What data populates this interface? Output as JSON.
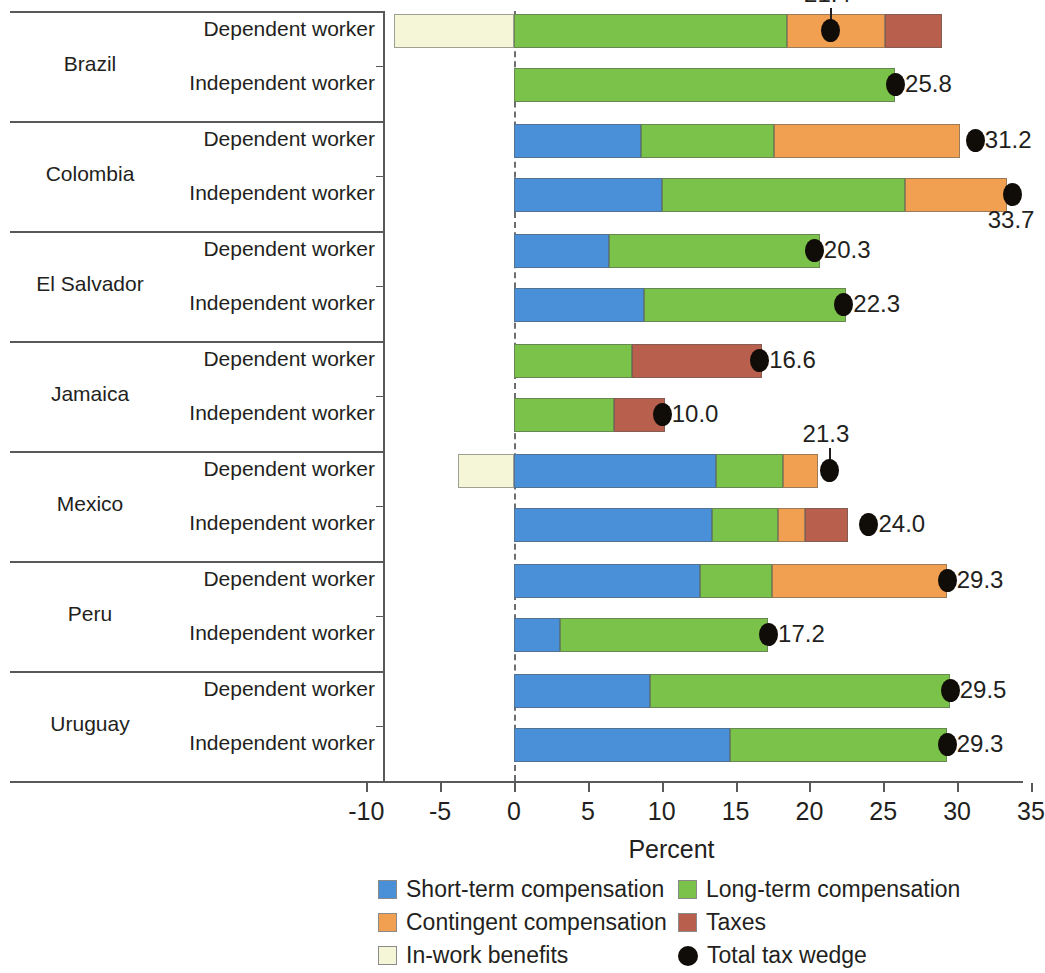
{
  "chart_data": {
    "type": "bar",
    "orientation": "horizontal",
    "stacked": true,
    "title": "",
    "xlabel": "Percent",
    "ylabel": "",
    "xlim": [
      -11.5,
      35.5
    ],
    "xticks": [
      -10,
      -5,
      0,
      5,
      10,
      15,
      20,
      25,
      30,
      35
    ],
    "xticklabels": [
      "-10",
      "-5",
      "0",
      "5",
      "10",
      "15",
      "20",
      "25",
      "30",
      "35"
    ],
    "grid": false,
    "zero_reference_line": true,
    "legend_position": "bottom",
    "series": [
      {
        "name": "Short-term compensation",
        "color": "#4a90d9"
      },
      {
        "name": "Long-term compensation",
        "color": "#7ac24a"
      },
      {
        "name": "Contingent compensation",
        "color": "#f0a050"
      },
      {
        "name": "Taxes",
        "color": "#b8604d"
      },
      {
        "name": "In-work benefits",
        "color": "#f5f6d8"
      }
    ],
    "marker": {
      "name": "Total tax wedge",
      "color": "#100c08",
      "shape": "circle"
    },
    "groups": [
      {
        "country": "Brazil",
        "rows": [
          {
            "worker": "Dependent worker",
            "in_work_benefits": -8.1,
            "short_term": 0.0,
            "long_term": 18.5,
            "contingent": 6.6,
            "taxes": 3.9,
            "total_tax_wedge": 21.4,
            "label": "21.4",
            "label_above": true
          },
          {
            "worker": "Independent worker",
            "in_work_benefits": 0.0,
            "short_term": 0.0,
            "long_term": 25.8,
            "contingent": 0.0,
            "taxes": 0.0,
            "total_tax_wedge": 25.8,
            "label": "25.8",
            "label_above": false
          }
        ]
      },
      {
        "country": "Colombia",
        "rows": [
          {
            "worker": "Dependent worker",
            "in_work_benefits": 0.0,
            "short_term": 8.6,
            "long_term": 9.0,
            "contingent": 12.6,
            "taxes": 0.0,
            "total_tax_wedge": 31.2,
            "label": "31.2",
            "label_above": false
          },
          {
            "worker": "Independent worker",
            "in_work_benefits": 0.0,
            "short_term": 10.0,
            "long_term": 16.5,
            "contingent": 6.9,
            "taxes": 0.0,
            "total_tax_wedge": 33.7,
            "label": "33.7",
            "label_above": false,
            "label_below": true
          }
        ]
      },
      {
        "country": "El Salvador",
        "rows": [
          {
            "worker": "Dependent worker",
            "in_work_benefits": 0.0,
            "short_term": 6.4,
            "long_term": 14.3,
            "contingent": 0.0,
            "taxes": 0.0,
            "total_tax_wedge": 20.3,
            "label": "20.3",
            "label_above": false
          },
          {
            "worker": "Independent worker",
            "in_work_benefits": 0.0,
            "short_term": 8.8,
            "long_term": 13.7,
            "contingent": 0.0,
            "taxes": 0.0,
            "total_tax_wedge": 22.3,
            "label": "22.3",
            "label_above": false
          }
        ]
      },
      {
        "country": "Jamaica",
        "rows": [
          {
            "worker": "Dependent worker",
            "in_work_benefits": 0.0,
            "short_term": 0.0,
            "long_term": 8.0,
            "contingent": 0.0,
            "taxes": 8.8,
            "total_tax_wedge": 16.6,
            "label": "16.6",
            "label_above": false
          },
          {
            "worker": "Independent worker",
            "in_work_benefits": 0.0,
            "short_term": 0.0,
            "long_term": 6.8,
            "contingent": 0.0,
            "taxes": 3.4,
            "total_tax_wedge": 10.0,
            "label": "10.0",
            "label_above": false
          }
        ]
      },
      {
        "country": "Mexico",
        "rows": [
          {
            "worker": "Dependent worker",
            "in_work_benefits": -3.8,
            "short_term": 13.7,
            "long_term": 4.5,
            "contingent": 2.4,
            "taxes": 0.0,
            "total_tax_wedge": 21.3,
            "label": "21.3",
            "label_above": true
          },
          {
            "worker": "Independent worker",
            "in_work_benefits": 0.0,
            "short_term": 13.4,
            "long_term": 4.5,
            "contingent": 1.8,
            "taxes": 2.9,
            "total_tax_wedge": 24.0,
            "label": "24.0",
            "label_above": false
          }
        ]
      },
      {
        "country": "Peru",
        "rows": [
          {
            "worker": "Dependent worker",
            "in_work_benefits": 0.0,
            "short_term": 12.6,
            "long_term": 4.9,
            "contingent": 11.8,
            "taxes": 0.0,
            "total_tax_wedge": 29.3,
            "label": "29.3",
            "label_above": false
          },
          {
            "worker": "Independent worker",
            "in_work_benefits": 0.0,
            "short_term": 3.1,
            "long_term": 14.1,
            "contingent": 0.0,
            "taxes": 0.0,
            "total_tax_wedge": 17.2,
            "label": "17.2",
            "label_above": false
          }
        ]
      },
      {
        "country": "Uruguay",
        "rows": [
          {
            "worker": "Dependent worker",
            "in_work_benefits": 0.0,
            "short_term": 9.2,
            "long_term": 20.3,
            "contingent": 0.0,
            "taxes": 0.0,
            "total_tax_wedge": 29.5,
            "label": "29.5",
            "label_above": false
          },
          {
            "worker": "Independent worker",
            "in_work_benefits": 0.0,
            "short_term": 14.6,
            "long_term": 14.7,
            "contingent": 0.0,
            "taxes": 0.0,
            "total_tax_wedge": 29.3,
            "label": "29.3",
            "label_above": false
          }
        ]
      }
    ]
  },
  "axis": {
    "title": "Percent"
  },
  "legend": {
    "items": [
      {
        "label": "Short-term compensation",
        "color": "#4a90d9",
        "shape": "square"
      },
      {
        "label": "Long-term compensation",
        "color": "#7ac24a",
        "shape": "square"
      },
      {
        "label": "Contingent compensation",
        "color": "#f0a050",
        "shape": "square"
      },
      {
        "label": "Taxes",
        "color": "#b8604d",
        "shape": "square"
      },
      {
        "label": "In-work benefits",
        "color": "#f5f6d8",
        "shape": "square"
      },
      {
        "label": "Total tax wedge",
        "color": "#100c08",
        "shape": "circle"
      }
    ]
  }
}
